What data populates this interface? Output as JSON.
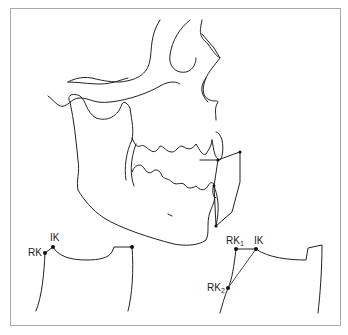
{
  "figure": {
    "stroke_color": "#222222",
    "frame_color": "#a8a8a8"
  },
  "labels": {
    "left": {
      "ik": "IK",
      "rk": "RK"
    },
    "right": {
      "rk1_base": "RK",
      "rk1_sub": "1",
      "ik": "IK",
      "rk2_base": "RK",
      "rk2_sub": "2"
    }
  }
}
